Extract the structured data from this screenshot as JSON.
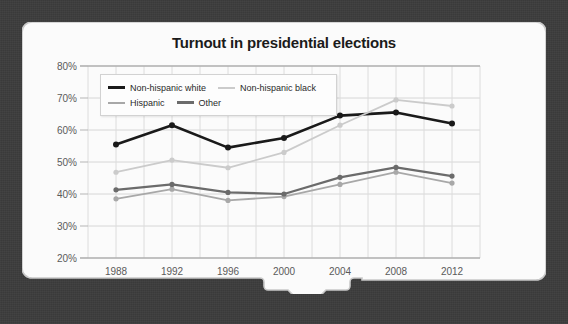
{
  "card": {
    "background_color": "#fbfbfb",
    "border_color": "#c8c8c8",
    "backdrop_color": "#3c3c3c"
  },
  "chart_data": {
    "type": "line",
    "title": "Turnout in presidential elections",
    "xlabel": "",
    "ylabel": "",
    "categories": [
      "1988",
      "1992",
      "1996",
      "2000",
      "2004",
      "2008",
      "2012"
    ],
    "x": [
      1988,
      1992,
      1996,
      2000,
      2004,
      2008,
      2012
    ],
    "ylim": [
      20,
      80
    ],
    "ytick_labels": [
      "20%",
      "30%",
      "40%",
      "50%",
      "60%",
      "70%",
      "80%"
    ],
    "ytick_values": [
      20,
      30,
      40,
      50,
      60,
      70,
      80
    ],
    "grid": true,
    "legend_position": "top-left",
    "series": [
      {
        "name": "Non-hispanic white",
        "color": "#1a1a1a",
        "values": [
          55.5,
          61.5,
          54.5,
          57.5,
          64.5,
          65.5,
          62.0
        ]
      },
      {
        "name": "Non-hispanic black",
        "color": "#cbcbcb",
        "values": [
          46.8,
          50.6,
          48.2,
          53.0,
          61.5,
          69.4,
          67.5
        ]
      },
      {
        "name": "Hispanic",
        "color": "#a8a8a8",
        "values": [
          38.5,
          41.5,
          38.0,
          39.2,
          43.0,
          46.8,
          43.4
        ]
      },
      {
        "name": "Other",
        "color": "#6b6b6b",
        "values": [
          41.3,
          43.0,
          40.5,
          40.0,
          45.2,
          48.3,
          45.6
        ]
      }
    ]
  },
  "legend": {
    "rows": [
      [
        {
          "label": "Non-hispanic white",
          "color": "#1a1a1a",
          "weight": "bold"
        },
        {
          "label": "Non-hispanic black",
          "color": "#cbcbcb",
          "weight": "normal"
        }
      ],
      [
        {
          "label": "Hispanic",
          "color": "#a8a8a8",
          "weight": "normal"
        },
        {
          "label": "Other",
          "color": "#6b6b6b",
          "weight": "bold"
        }
      ]
    ]
  }
}
